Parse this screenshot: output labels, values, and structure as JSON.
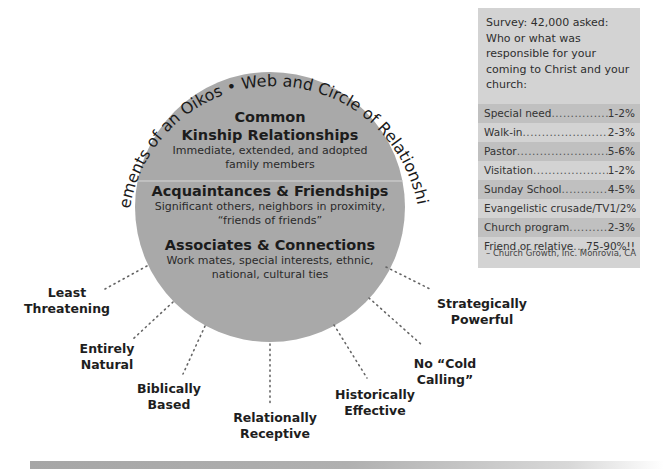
{
  "diagram": {
    "arc_title": "Elements of an Oikos • Web and Circle of Relationships",
    "circle_color": "#a9a9a9",
    "rings": [
      {
        "title_line1": "Common",
        "title_line2": "Kinship Relationships",
        "desc_line1": "Immediate, extended, and adopted",
        "desc_line2": "family members"
      },
      {
        "title": "Acquaintances & Friendships",
        "desc_line1": "Significant others, neighbors in proximity,",
        "desc_line2": "“friends of friends”"
      },
      {
        "title": "Associates & Connections",
        "desc_line1": "Work mates, special interests, ethnic,",
        "desc_line2": "national, cultural ties"
      }
    ],
    "benefits": [
      {
        "line1": "Least",
        "line2": "Threatening"
      },
      {
        "line1": "Entirely",
        "line2": "Natural"
      },
      {
        "line1": "Biblically",
        "line2": "Based"
      },
      {
        "line1": "Relationally",
        "line2": "Receptive"
      },
      {
        "line1": "Historically",
        "line2": "Effective"
      },
      {
        "line1": "No “Cold",
        "line2": "Calling”"
      },
      {
        "line1": "Strategically",
        "line2": "Powerful"
      }
    ]
  },
  "survey": {
    "intro": "Survey: 42,000 asked: Who or what was responsible for your coming to Christ and your church:",
    "rows": [
      {
        "name": "Special need",
        "value": "1-2%"
      },
      {
        "name": "Walk-in",
        "value": "2-3%"
      },
      {
        "name": "Pastor",
        "value": "5-6%"
      },
      {
        "name": "Visitation",
        "value": "1-2%"
      },
      {
        "name": "Sunday School",
        "value": "4-5%"
      },
      {
        "name": "Evangelistic crusade/TV",
        "value": "1/2%"
      },
      {
        "name": "Church program",
        "value": "2-3%"
      },
      {
        "name": "Friend or relative",
        "value": "75-90%!!"
      }
    ],
    "source": "– Church Growth, Inc. Monrovia, CA"
  }
}
